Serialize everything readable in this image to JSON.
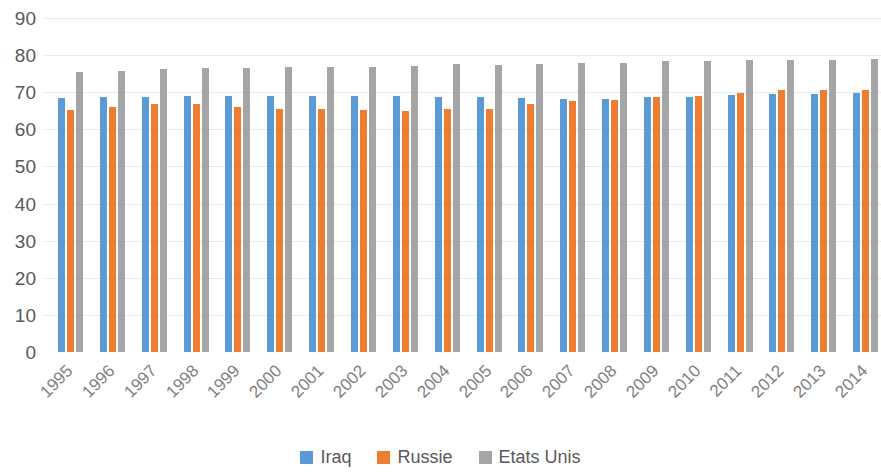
{
  "chart_data": {
    "type": "bar",
    "title": "",
    "subtitle": "",
    "xlabel": "",
    "ylabel": "",
    "ylim": [
      0,
      90
    ],
    "y_ticks": [
      0,
      10,
      20,
      30,
      40,
      50,
      60,
      70,
      80,
      90
    ],
    "grid": true,
    "legend_position": "bottom",
    "categories": [
      "1995",
      "1996",
      "1997",
      "1998",
      "1999",
      "2000",
      "2001",
      "2002",
      "2003",
      "2004",
      "2005",
      "2006",
      "2007",
      "2008",
      "2009",
      "2010",
      "2011",
      "2012",
      "2013",
      "2014"
    ],
    "series": [
      {
        "name": "Iraq",
        "color": "#5B9BD5",
        "values": [
          68.5,
          68.6,
          68.7,
          69.0,
          69.0,
          69.0,
          69.0,
          69.0,
          68.9,
          68.7,
          68.6,
          68.4,
          68.2,
          68.3,
          68.6,
          68.8,
          69.2,
          69.4,
          69.6,
          69.7
        ]
      },
      {
        "name": "Russie",
        "color": "#ED7D31",
        "values": [
          65.1,
          66.0,
          66.8,
          66.9,
          66.0,
          65.5,
          65.4,
          65.2,
          64.9,
          65.5,
          65.6,
          66.8,
          67.6,
          68.0,
          68.8,
          68.9,
          69.8,
          70.5,
          70.6,
          70.7
        ]
      },
      {
        "name": "Etats Unis",
        "color": "#A5A5A5",
        "values": [
          75.5,
          75.8,
          76.2,
          76.4,
          76.4,
          76.7,
          76.8,
          76.9,
          77.0,
          77.5,
          77.4,
          77.6,
          77.8,
          78.0,
          78.3,
          78.5,
          78.6,
          78.7,
          78.8,
          78.9
        ]
      }
    ]
  },
  "legend": {
    "items": [
      {
        "label": "Iraq",
        "color": "#5B9BD5"
      },
      {
        "label": "Russie",
        "color": "#ED7D31"
      },
      {
        "label": "Etats Unis",
        "color": "#A5A5A5"
      }
    ]
  }
}
